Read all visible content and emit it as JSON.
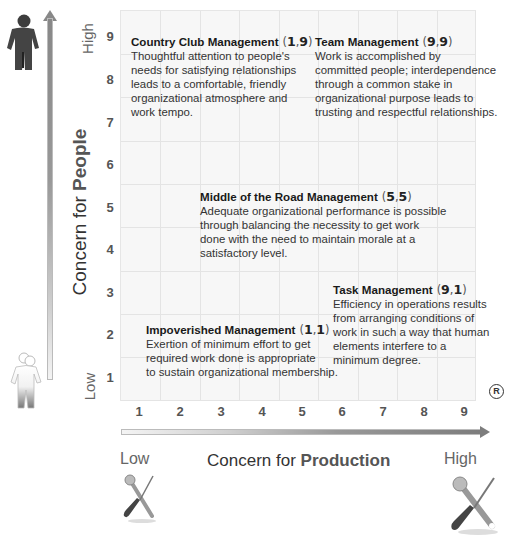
{
  "diagram": {
    "y_axis": {
      "label_prefix": "Concern for ",
      "label_emphasis": "People",
      "low_label": "Low",
      "high_label": "High",
      "ticks": [
        "1",
        "2",
        "3",
        "4",
        "5",
        "6",
        "7",
        "8",
        "9"
      ]
    },
    "x_axis": {
      "label_prefix": "Concern for ",
      "label_emphasis": "Production",
      "low_label": "Low",
      "high_label": "High",
      "ticks": [
        "1",
        "2",
        "3",
        "4",
        "5",
        "6",
        "7",
        "8",
        "9"
      ]
    },
    "registered_mark": "R",
    "icons": {
      "y_high": "person-dark-icon",
      "y_low": "person-faded-icon",
      "x_low": "tools-small-icon",
      "x_high": "tools-large-icon"
    },
    "styles": [
      {
        "name": "Country Club Management",
        "x": "1",
        "y": "9",
        "description_lines": [
          "Thoughtful attention to people's",
          "needs for satisfying relationships",
          "leads to a comfortable, friendly",
          "organizational atmosphere and",
          "work tempo."
        ]
      },
      {
        "name": "Team Management",
        "x": "9",
        "y": "9",
        "description_lines": [
          "Work is accomplished by",
          "committed people; interdependence",
          "through a common stake in",
          "organizational purpose leads to",
          "trusting and respectful relationships."
        ]
      },
      {
        "name": "Middle of the Road Management",
        "x": "5",
        "y": "5",
        "description_lines": [
          "Adequate organizational performance is possible",
          "through balancing the necessity to get work",
          "done with the need to maintain morale at a",
          "satisfactory level."
        ]
      },
      {
        "name": "Task Management",
        "x": "9",
        "y": "1",
        "description_lines": [
          "Efficiency in operations results",
          "from arranging conditions of",
          "work in such a way that human",
          "elements interfere to a",
          "minimum degree."
        ]
      },
      {
        "name": "Impoverished Management",
        "x": "1",
        "y": "1",
        "description_lines": [
          "Exertion of minimum effort to get",
          "required work done is appropriate",
          "to sustain organizational membership."
        ]
      }
    ],
    "colors": {
      "grid_bg": "#f7f7f7",
      "grid_line": "#e4e4e4",
      "arrow_dark": "#7d7d7d",
      "text": "#333333"
    }
  }
}
